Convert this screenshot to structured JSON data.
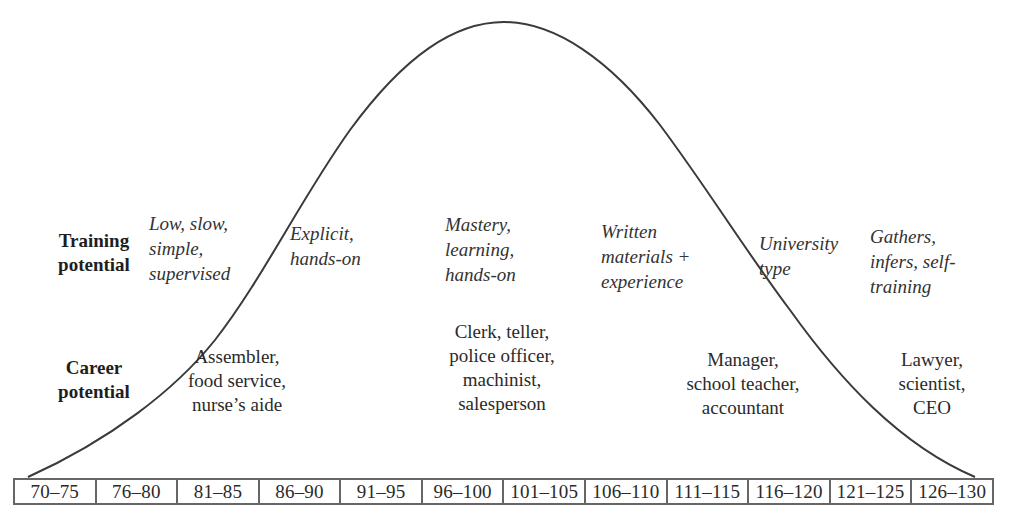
{
  "row_labels": {
    "training": "Training\npotential",
    "career": "Career\npotential"
  },
  "training_potential": [
    {
      "text": "Low, slow,\nsimple,\nsupervised",
      "range": "70–80"
    },
    {
      "text": "Explicit,\nhands-on",
      "range": "81–90"
    },
    {
      "text": "Mastery,\nlearning,\nhands-on",
      "range": "96–100"
    },
    {
      "text": "Written\nmaterials +\nexperience",
      "range": "106–110"
    },
    {
      "text": "University\ntype",
      "range": "116–120"
    },
    {
      "text": "Gathers,\ninfers, self-\ntraining",
      "range": "121–130"
    }
  ],
  "career_potential": [
    {
      "text": "Assembler,\nfood service,\nnurse’s aide"
    },
    {
      "text": "Clerk, teller,\npolice officer,\nmachinist,\nsalesperson"
    },
    {
      "text": "Manager,\nschool teacher,\naccountant"
    },
    {
      "text": "Lawyer,\nscientist,\nCEO"
    }
  ],
  "iq_ranges": [
    "70–75",
    "76–80",
    "81–85",
    "86–90",
    "91–95",
    "96–100",
    "101–105",
    "106–110",
    "111–115",
    "116–120",
    "121–125",
    "126–130"
  ],
  "colors": {
    "curve": "#3a3a3a",
    "border": "#666666",
    "text": "#2a2a2a",
    "background": "#ffffff"
  },
  "curve": {
    "type": "normal-distribution",
    "start": [
      28,
      477
    ],
    "peak": [
      504,
      22
    ],
    "end": [
      975,
      477
    ]
  }
}
